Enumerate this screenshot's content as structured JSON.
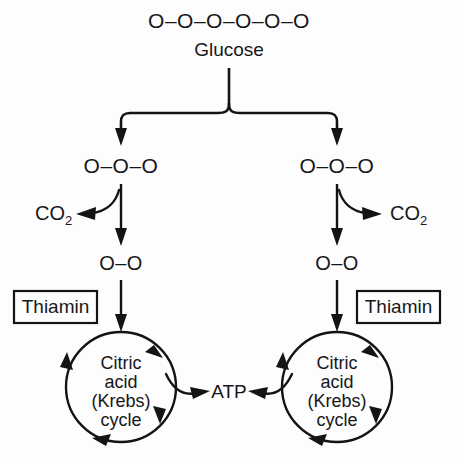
{
  "diagram": {
    "background_color": "#fdfdfd",
    "ink_color": "#141417",
    "glucose": {
      "chain": "O–O–O–O–O–O",
      "name": "Glucose",
      "carbon_count": 6
    },
    "split": {
      "left": {
        "chain": "O–O–O",
        "carbon_count": 3
      },
      "right": {
        "chain": "O–O–O",
        "carbon_count": 3
      }
    },
    "co2": {
      "left_label": "CO",
      "left_subscript": "2",
      "right_label": "CO",
      "right_subscript": "2"
    },
    "two_carbon": {
      "left": "O–O",
      "right": "O–O",
      "carbon_count": 2
    },
    "cofactor": {
      "left_label": "Thiamin",
      "right_label": "Thiamin"
    },
    "cycle": {
      "left_lines": [
        "Citric",
        "acid",
        "(Krebs)",
        "cycle"
      ],
      "right_lines": [
        "Citric",
        "acid",
        "(Krebs)",
        "cycle"
      ],
      "direction": "clockwise"
    },
    "product": {
      "label": "ATP"
    }
  }
}
